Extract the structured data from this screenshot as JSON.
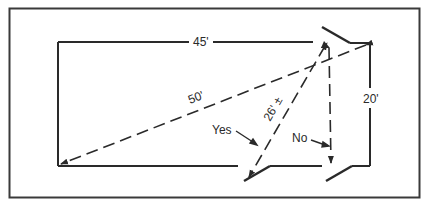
{
  "diagram": {
    "labels": {
      "width": "45'",
      "height": "20'",
      "diagonal": "50'",
      "short_diagonal": "26' ±",
      "yes": "Yes",
      "no": "No"
    },
    "colors": {
      "line": "#2a2a2a",
      "background": "#ffffff"
    }
  }
}
